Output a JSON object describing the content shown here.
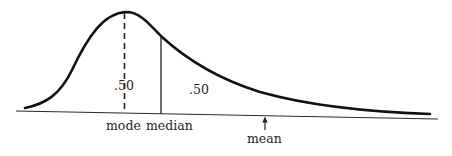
{
  "figure": {
    "type": "positively skewed distribution curve",
    "area_labels": {
      "left_of_median": ".50",
      "right_of_median": ".50"
    },
    "axis_markers": {
      "mode": "mode",
      "median": "median",
      "mean": "mean"
    },
    "colors": {
      "ink": "#1e1e1e",
      "background": "#ffffff"
    }
  }
}
